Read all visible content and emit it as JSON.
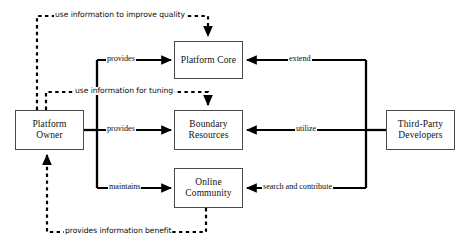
{
  "diagram": {
    "style": {
      "background": "#ffffff",
      "node_border": "#4a4a4a",
      "solid_edge_color": "#000000",
      "dashed_edge_color": "#000000",
      "text_color": "#111111"
    },
    "nodes": [
      {
        "id": "platform-owner",
        "label": "Platform\nOwner",
        "x": 15,
        "y": 110,
        "w": 69,
        "h": 40
      },
      {
        "id": "platform-core",
        "label": "Platform Core",
        "x": 174,
        "y": 41,
        "w": 69,
        "h": 38
      },
      {
        "id": "boundary-resources",
        "label": "Boundary\nResources",
        "x": 174,
        "y": 110,
        "w": 69,
        "h": 40
      },
      {
        "id": "online-community",
        "label": "Online\nCommunity",
        "x": 174,
        "y": 168,
        "w": 69,
        "h": 40
      },
      {
        "id": "third-party-developers",
        "label": "Third-Party\nDevelopers",
        "x": 386,
        "y": 110,
        "w": 69,
        "h": 40
      }
    ],
    "edges": [
      {
        "id": "owner-provides-core",
        "label": "provides",
        "from": "platform-owner",
        "to": "platform-core",
        "style": "solid",
        "label_x": 106,
        "label_y": 55
      },
      {
        "id": "owner-provides-boundary",
        "label": "provides",
        "from": "platform-owner",
        "to": "boundary-resources",
        "style": "solid",
        "label_x": 106,
        "label_y": 125
      },
      {
        "id": "owner-maintains-community",
        "label": "maintains",
        "from": "platform-owner",
        "to": "online-community",
        "style": "solid",
        "label_x": 108,
        "label_y": 183
      },
      {
        "id": "devs-extend-core",
        "label": "extend",
        "from": "third-party-developers",
        "to": "platform-core",
        "style": "solid",
        "label_x": 288,
        "label_y": 55
      },
      {
        "id": "devs-utilize-boundary",
        "label": "utilize",
        "from": "third-party-developers",
        "to": "boundary-resources",
        "style": "solid",
        "label_x": 295,
        "label_y": 125
      },
      {
        "id": "devs-search-contribute-community",
        "label": "search and contribute",
        "from": "third-party-developers",
        "to": "online-community",
        "style": "solid",
        "label_x": 262,
        "label_y": 183
      },
      {
        "id": "improve-quality",
        "label": "use information to improve quality",
        "from": "platform-owner",
        "to": "platform-core",
        "style": "dashed",
        "label_x": 54,
        "label_y": 11
      },
      {
        "id": "tuning",
        "label": "use information for tuning",
        "from": "platform-owner",
        "to": "boundary-resources",
        "style": "dashed",
        "label_x": 74,
        "label_y": 87
      },
      {
        "id": "information-benefit",
        "label": "provides information benefit",
        "from": "online-community",
        "to": "platform-owner",
        "style": "dashed",
        "label_x": 64,
        "label_y": 227
      }
    ]
  }
}
